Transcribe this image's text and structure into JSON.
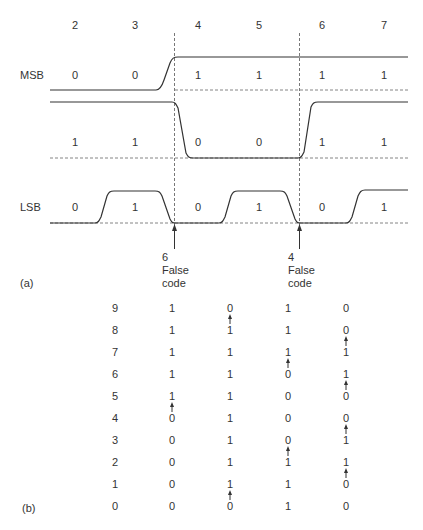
{
  "part_a": {
    "label": "(a)",
    "column_labels": [
      "2",
      "3",
      "4",
      "5",
      "6",
      "7"
    ],
    "signals": [
      {
        "name": "MSB",
        "bits": [
          "0",
          "0",
          "1",
          "1",
          "1",
          "1"
        ]
      },
      {
        "name": "",
        "bits": [
          "1",
          "1",
          "0",
          "0",
          "1",
          "1"
        ]
      },
      {
        "name": "LSB",
        "bits": [
          "0",
          "1",
          "0",
          "1",
          "0",
          "1"
        ]
      }
    ],
    "false_codes": [
      {
        "value": "6",
        "line1": "False",
        "line2": "code"
      },
      {
        "value": "4",
        "line1": "False",
        "line2": "code"
      }
    ]
  },
  "part_b": {
    "label": "(b)",
    "rows": [
      {
        "n": "9",
        "cols": [
          "1",
          "0",
          "1",
          "0"
        ],
        "arrows": [
          false,
          true,
          false,
          false
        ]
      },
      {
        "n": "8",
        "cols": [
          "1",
          "1",
          "1",
          "0"
        ],
        "arrows": [
          false,
          false,
          false,
          true
        ]
      },
      {
        "n": "7",
        "cols": [
          "1",
          "1",
          "1",
          "1"
        ],
        "arrows": [
          false,
          false,
          true,
          false
        ]
      },
      {
        "n": "6",
        "cols": [
          "1",
          "1",
          "0",
          "1"
        ],
        "arrows": [
          false,
          false,
          false,
          true
        ]
      },
      {
        "n": "5",
        "cols": [
          "1",
          "1",
          "0",
          "0"
        ],
        "arrows": [
          true,
          false,
          false,
          false
        ]
      },
      {
        "n": "4",
        "cols": [
          "0",
          "1",
          "0",
          "0"
        ],
        "arrows": [
          false,
          false,
          false,
          true
        ]
      },
      {
        "n": "3",
        "cols": [
          "0",
          "1",
          "0",
          "1"
        ],
        "arrows": [
          false,
          false,
          true,
          false
        ]
      },
      {
        "n": "2",
        "cols": [
          "0",
          "1",
          "1",
          "1"
        ],
        "arrows": [
          false,
          false,
          false,
          true
        ]
      },
      {
        "n": "1",
        "cols": [
          "0",
          "1",
          "1",
          "0"
        ],
        "arrows": [
          false,
          true,
          false,
          false
        ]
      },
      {
        "n": "0",
        "cols": [
          "0",
          "0",
          "1",
          "0"
        ],
        "arrows": [
          false,
          false,
          false,
          false
        ]
      }
    ]
  },
  "caption": ""
}
